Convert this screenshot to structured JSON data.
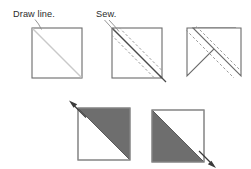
{
  "diagram": {
    "background_color": "#ffffff",
    "colors": {
      "square_outline": "#6b6b6b",
      "square_outline_dark": "#555555",
      "draw_line": "#c6c6c6",
      "sew_line": "#4a4a4a",
      "stitch_dash": "#9a9a9a",
      "fabric_dark": "#6e6e6e",
      "fabric_light": "#ffffff",
      "arrow": "#3a3a3a",
      "leader": "#7a7a7a",
      "text": "#2b2b2b"
    },
    "labels": [
      {
        "id": "draw-line-label",
        "text": "Draw line.",
        "x": 13,
        "y": 17
      },
      {
        "id": "sew-label",
        "text": "Sew.",
        "x": 96,
        "y": 17
      }
    ],
    "steps": [
      {
        "id": "step-1-draw-line",
        "caption": "Draw line.",
        "square": {
          "x": 32,
          "y": 28,
          "size": 50
        },
        "features": [
          "diagonal-guide-line"
        ]
      },
      {
        "id": "step-2-sew",
        "caption": "Sew.",
        "square": {
          "x": 112,
          "y": 28,
          "size": 50
        },
        "features": [
          "diagonal-guide-line",
          "stitch-line-upper",
          "stitch-line-lower"
        ]
      },
      {
        "id": "step-3-cut",
        "caption": "",
        "square": {
          "x": 187,
          "y": 28,
          "size": 50
        },
        "features": [
          "cut-apart",
          "stitch-line-upper",
          "stitch-line-lower"
        ]
      },
      {
        "id": "step-4-press-left",
        "caption": "",
        "square": {
          "x": 78,
          "y": 108,
          "size": 52
        },
        "features": [
          "half-square-triangle-upper-right-dark",
          "press-arrow-up-left"
        ]
      },
      {
        "id": "step-5-press-right",
        "caption": "",
        "square": {
          "x": 152,
          "y": 110,
          "size": 52
        },
        "features": [
          "half-square-triangle-lower-left-dark",
          "press-arrow-down-right"
        ]
      }
    ],
    "arrows": [
      {
        "id": "press-arrow-up-left",
        "direction": "up-left",
        "from_x": 86,
        "from_y": 117,
        "to_x": 70,
        "to_y": 101
      },
      {
        "id": "press-arrow-down-right",
        "direction": "down-right",
        "from_x": 198,
        "from_y": 150,
        "to_x": 215,
        "to_y": 165
      }
    ],
    "leaders": [
      {
        "id": "draw-line-leader",
        "from_x": 36,
        "from_y": 19,
        "to_x": 41,
        "to_y": 29
      },
      {
        "id": "sew-leader-a",
        "from_x": 105,
        "from_y": 20,
        "to_x": 115,
        "to_y": 32
      },
      {
        "id": "sew-leader-b",
        "from_x": 110,
        "from_y": 20,
        "to_x": 120,
        "to_y": 32
      }
    ]
  }
}
